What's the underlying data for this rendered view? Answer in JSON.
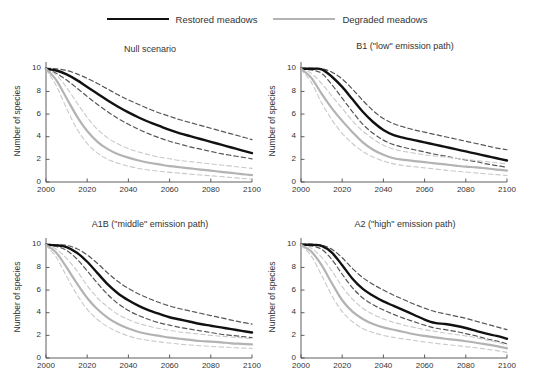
{
  "legend": {
    "entries": [
      {
        "label": "Restored meadows",
        "style": "solid",
        "color": "#111111",
        "key": "restored"
      },
      {
        "label": "Degraded meadows",
        "style": "solid",
        "color": "#b3b3b3",
        "key": "degraded"
      }
    ]
  },
  "axis": {
    "ylabel": "Number of species",
    "yticks": [
      "0",
      "2",
      "4",
      "6",
      "8",
      "10"
    ],
    "xticks": [
      "2000",
      "2020",
      "2040",
      "2060",
      "2080",
      "2100"
    ]
  },
  "panels": [
    {
      "id": "null",
      "title": "Null scenario"
    },
    {
      "id": "b1",
      "title": "B1 (\"low\" emission path)"
    },
    {
      "id": "a1b",
      "title": "A1B (\"middle\" emission path)"
    },
    {
      "id": "a2",
      "title": "A2 (\"high\" emission path)"
    }
  ],
  "chart_data": {
    "type": "line",
    "xlabel": "",
    "ylabel": "Number of species",
    "xlim": [
      2000,
      2100
    ],
    "ylim": [
      0,
      10.6
    ],
    "grid": false,
    "legend_position": "top-center",
    "x": [
      2000,
      2005,
      2010,
      2015,
      2020,
      2025,
      2030,
      2035,
      2040,
      2045,
      2050,
      2055,
      2060,
      2065,
      2070,
      2075,
      2080,
      2085,
      2090,
      2095,
      2100
    ],
    "panels": [
      {
        "id": "null",
        "title": "Null scenario",
        "series": [
          {
            "name": "Restored meadows",
            "color": "#111111",
            "style": "solid",
            "width": 2.4,
            "values": [
              10.0,
              9.85,
              9.5,
              9.0,
              8.4,
              7.8,
              7.2,
              6.65,
              6.15,
              5.7,
              5.3,
              4.95,
              4.6,
              4.3,
              4.05,
              3.8,
              3.55,
              3.3,
              3.05,
              2.8,
              2.55
            ]
          },
          {
            "name": "Restored meadows upper CI",
            "color": "#555555",
            "style": "dashed",
            "width": 1.2,
            "values": [
              10.05,
              10.0,
              9.85,
              9.55,
              9.15,
              8.7,
              8.2,
              7.7,
              7.25,
              6.85,
              6.45,
              6.1,
              5.8,
              5.5,
              5.25,
              5.0,
              4.75,
              4.5,
              4.25,
              4.0,
              3.75
            ]
          },
          {
            "name": "Restored meadows lower CI",
            "color": "#555555",
            "style": "dashed",
            "width": 1.2,
            "values": [
              9.95,
              9.6,
              9.0,
              8.3,
              7.55,
              6.85,
              6.2,
              5.6,
              5.1,
              4.65,
              4.25,
              3.9,
              3.6,
              3.35,
              3.1,
              2.9,
              2.7,
              2.5,
              2.35,
              2.2,
              2.05
            ]
          },
          {
            "name": "Degraded meadows",
            "color": "#b3b3b3",
            "style": "solid",
            "width": 2.2,
            "values": [
              10.0,
              9.0,
              7.4,
              5.8,
              4.5,
              3.55,
              2.9,
              2.45,
              2.15,
              1.9,
              1.7,
              1.55,
              1.4,
              1.3,
              1.2,
              1.1,
              1.0,
              0.9,
              0.8,
              0.7,
              0.6
            ]
          },
          {
            "name": "Degraded meadows upper CI",
            "color": "#c9c9c9",
            "style": "dashed",
            "width": 1.1,
            "values": [
              10.05,
              9.45,
              8.35,
              7.0,
              5.7,
              4.65,
              3.9,
              3.35,
              2.95,
              2.65,
              2.4,
              2.2,
              2.05,
              1.9,
              1.8,
              1.7,
              1.6,
              1.5,
              1.4,
              1.3,
              1.2
            ]
          },
          {
            "name": "Degraded meadows lower CI",
            "color": "#c9c9c9",
            "style": "dashed",
            "width": 1.1,
            "values": [
              9.95,
              8.5,
              6.5,
              4.7,
              3.4,
              2.55,
              2.0,
              1.65,
              1.4,
              1.2,
              1.05,
              0.95,
              0.85,
              0.78,
              0.7,
              0.62,
              0.55,
              0.48,
              0.4,
              0.32,
              0.25
            ]
          }
        ]
      },
      {
        "id": "b1",
        "title": "B1 (\"low\" emission path)",
        "series": [
          {
            "name": "Restored meadows",
            "color": "#111111",
            "style": "solid",
            "width": 2.4,
            "values": [
              10.0,
              10.0,
              9.95,
              9.3,
              8.4,
              7.3,
              6.2,
              5.3,
              4.6,
              4.15,
              3.9,
              3.7,
              3.5,
              3.3,
              3.1,
              2.9,
              2.7,
              2.5,
              2.3,
              2.1,
              1.9
            ]
          },
          {
            "name": "Restored meadows upper CI",
            "color": "#555555",
            "style": "dashed",
            "width": 1.2,
            "values": [
              10.05,
              10.05,
              10.0,
              9.7,
              9.1,
              8.2,
              7.2,
              6.3,
              5.6,
              5.15,
              4.85,
              4.6,
              4.4,
              4.2,
              4.0,
              3.8,
              3.6,
              3.4,
              3.2,
              3.0,
              2.85
            ]
          },
          {
            "name": "Restored meadows lower CI",
            "color": "#555555",
            "style": "dashed",
            "width": 1.2,
            "values": [
              9.95,
              9.9,
              9.6,
              8.6,
              7.4,
              6.2,
              5.1,
              4.3,
              3.7,
              3.3,
              3.05,
              2.85,
              2.65,
              2.45,
              2.3,
              2.1,
              1.95,
              1.8,
              1.6,
              1.45,
              1.3
            ]
          },
          {
            "name": "Degraded meadows",
            "color": "#b3b3b3",
            "style": "solid",
            "width": 2.2,
            "values": [
              10.0,
              9.2,
              7.8,
              6.5,
              5.4,
              4.4,
              3.5,
              2.85,
              2.4,
              2.1,
              1.95,
              1.85,
              1.75,
              1.65,
              1.55,
              1.45,
              1.35,
              1.3,
              1.2,
              1.1,
              1.0
            ]
          },
          {
            "name": "Degraded meadows upper CI",
            "color": "#c9c9c9",
            "style": "dashed",
            "width": 1.1,
            "values": [
              10.05,
              9.6,
              8.7,
              7.6,
              6.5,
              5.4,
              4.5,
              3.8,
              3.25,
              2.9,
              2.7,
              2.55,
              2.4,
              2.3,
              2.2,
              2.1,
              2.0,
              1.9,
              1.8,
              1.7,
              1.6
            ]
          },
          {
            "name": "Degraded meadows lower CI",
            "color": "#c9c9c9",
            "style": "dashed",
            "width": 1.1,
            "values": [
              9.95,
              8.8,
              7.0,
              5.5,
              4.3,
              3.4,
              2.7,
              2.2,
              1.85,
              1.6,
              1.45,
              1.35,
              1.25,
              1.15,
              1.05,
              0.95,
              0.88,
              0.8,
              0.72,
              0.65,
              0.58
            ]
          }
        ]
      },
      {
        "id": "a1b",
        "title": "A1B (\"middle\" emission path)",
        "series": [
          {
            "name": "Restored meadows",
            "color": "#111111",
            "style": "solid",
            "width": 2.4,
            "values": [
              10.0,
              9.95,
              9.8,
              9.3,
              8.5,
              7.5,
              6.5,
              5.7,
              5.1,
              4.6,
              4.2,
              3.9,
              3.6,
              3.4,
              3.2,
              3.0,
              2.85,
              2.7,
              2.55,
              2.4,
              2.25
            ]
          },
          {
            "name": "Restored meadows upper CI",
            "color": "#555555",
            "style": "dashed",
            "width": 1.2,
            "values": [
              10.05,
              10.0,
              9.95,
              9.65,
              9.1,
              8.35,
              7.5,
              6.75,
              6.15,
              5.65,
              5.25,
              4.9,
              4.6,
              4.35,
              4.15,
              3.95,
              3.75,
              3.55,
              3.35,
              3.15,
              3.0
            ]
          },
          {
            "name": "Restored meadows lower CI",
            "color": "#555555",
            "style": "dashed",
            "width": 1.2,
            "values": [
              9.95,
              9.85,
              9.5,
              8.75,
              7.7,
              6.6,
              5.6,
              4.8,
              4.2,
              3.75,
              3.4,
              3.1,
              2.9,
              2.7,
              2.55,
              2.4,
              2.25,
              2.1,
              2.0,
              1.9,
              1.8
            ]
          },
          {
            "name": "Degraded meadows",
            "color": "#b3b3b3",
            "style": "solid",
            "width": 2.2,
            "values": [
              10.0,
              9.3,
              8.0,
              6.6,
              5.3,
              4.3,
              3.55,
              3.0,
              2.6,
              2.3,
              2.1,
              1.95,
              1.8,
              1.7,
              1.6,
              1.5,
              1.45,
              1.38,
              1.3,
              1.25,
              1.2
            ]
          },
          {
            "name": "Degraded meadows upper CI",
            "color": "#c9c9c9",
            "style": "dashed",
            "width": 1.1,
            "values": [
              10.05,
              9.6,
              8.8,
              7.7,
              6.4,
              5.3,
              4.5,
              3.85,
              3.4,
              3.05,
              2.8,
              2.6,
              2.45,
              2.3,
              2.2,
              2.1,
              2.0,
              1.92,
              1.85,
              1.78,
              1.7
            ]
          },
          {
            "name": "Degraded meadows lower CI",
            "color": "#c9c9c9",
            "style": "dashed",
            "width": 1.1,
            "values": [
              9.95,
              8.9,
              7.2,
              5.6,
              4.3,
              3.4,
              2.75,
              2.3,
              1.95,
              1.7,
              1.55,
              1.42,
              1.32,
              1.22,
              1.15,
              1.08,
              1.02,
              0.97,
              0.92,
              0.88,
              0.85
            ]
          }
        ]
      },
      {
        "id": "a2",
        "title": "A2 (\"high\" emission path)",
        "series": [
          {
            "name": "Restored meadows",
            "color": "#111111",
            "style": "solid",
            "width": 2.4,
            "values": [
              10.0,
              10.0,
              9.9,
              9.3,
              8.2,
              7.0,
              6.1,
              5.5,
              5.0,
              4.6,
              4.2,
              3.8,
              3.4,
              3.1,
              3.0,
              2.85,
              2.65,
              2.4,
              2.15,
              1.95,
              1.7
            ]
          },
          {
            "name": "Restored meadows upper CI",
            "color": "#555555",
            "style": "dashed",
            "width": 1.2,
            "values": [
              10.05,
              10.05,
              9.98,
              9.6,
              8.85,
              7.9,
              7.1,
              6.5,
              6.0,
              5.55,
              5.15,
              4.75,
              4.4,
              4.1,
              3.9,
              3.7,
              3.5,
              3.25,
              3.0,
              2.75,
              2.5
            ]
          },
          {
            "name": "Restored meadows lower CI",
            "color": "#555555",
            "style": "dashed",
            "width": 1.2,
            "values": [
              9.95,
              9.9,
              9.6,
              8.7,
              7.4,
              6.2,
              5.3,
              4.7,
              4.25,
              3.85,
              3.5,
              3.2,
              2.9,
              2.65,
              2.5,
              2.35,
              2.15,
              1.95,
              1.7,
              1.5,
              1.25
            ]
          },
          {
            "name": "Degraded meadows",
            "color": "#b3b3b3",
            "style": "solid",
            "width": 2.2,
            "values": [
              10.0,
              9.4,
              8.2,
              6.6,
              5.1,
              4.1,
              3.45,
              3.0,
              2.7,
              2.5,
              2.3,
              2.1,
              1.95,
              1.82,
              1.7,
              1.6,
              1.48,
              1.35,
              1.2,
              1.05,
              0.85
            ]
          },
          {
            "name": "Degraded meadows upper CI",
            "color": "#c9c9c9",
            "style": "dashed",
            "width": 1.1,
            "values": [
              10.05,
              9.7,
              8.9,
              7.7,
              6.3,
              5.2,
              4.4,
              3.85,
              3.45,
              3.15,
              2.9,
              2.7,
              2.5,
              2.35,
              2.2,
              2.08,
              1.95,
              1.8,
              1.6,
              1.4,
              1.15
            ]
          },
          {
            "name": "Degraded meadows lower CI",
            "color": "#c9c9c9",
            "style": "dashed",
            "width": 1.1,
            "values": [
              9.95,
              9.0,
              7.3,
              5.5,
              4.1,
              3.2,
              2.6,
              2.25,
              2.0,
              1.82,
              1.68,
              1.55,
              1.42,
              1.3,
              1.2,
              1.1,
              1.0,
              0.9,
              0.78,
              0.65,
              0.5
            ]
          }
        ]
      }
    ]
  }
}
